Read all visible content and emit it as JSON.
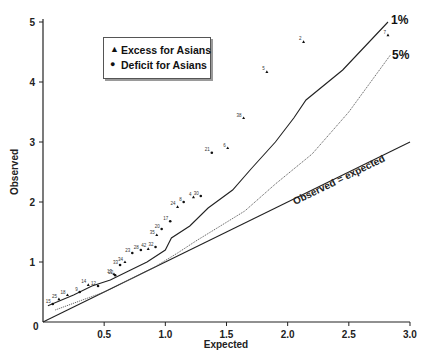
{
  "chart_data": {
    "type": "scatter",
    "title": "",
    "xlabel": "Expected",
    "ylabel": "Observed",
    "xlim": [
      0,
      3.0
    ],
    "ylim": [
      0,
      5
    ],
    "x_ticks": [
      "0.5",
      "1.0",
      "1.5",
      "2.0",
      "2.5",
      "3.0"
    ],
    "y_ticks": [
      "1",
      "2",
      "3",
      "4",
      "5"
    ],
    "origin_label": "0",
    "grid": false,
    "legend": {
      "position": "upper-left",
      "entries": [
        {
          "marker": "triangle",
          "label": "Excess for Asians"
        },
        {
          "marker": "circle",
          "label": "Deficit for Asians"
        }
      ]
    },
    "reference_lines": [
      {
        "name": "Observed = expected",
        "style": "solid",
        "points": [
          [
            0,
            0
          ],
          [
            3.0,
            3.0
          ]
        ]
      },
      {
        "name": "1%",
        "style": "solid",
        "points": [
          [
            0.04,
            0.27
          ],
          [
            0.25,
            0.45
          ],
          [
            0.4,
            0.6
          ],
          [
            0.55,
            0.7
          ],
          [
            0.7,
            0.85
          ],
          [
            0.85,
            1.0
          ],
          [
            1.0,
            1.2
          ],
          [
            1.05,
            1.4
          ],
          [
            1.2,
            1.6
          ],
          [
            1.35,
            1.9
          ],
          [
            1.55,
            2.2
          ],
          [
            1.7,
            2.55
          ],
          [
            1.9,
            3.0
          ],
          [
            2.05,
            3.4
          ],
          [
            2.15,
            3.7
          ],
          [
            2.45,
            4.2
          ],
          [
            2.82,
            5.0
          ]
        ]
      },
      {
        "name": "5%",
        "style": "dotted",
        "points": [
          [
            0.1,
            0.2
          ],
          [
            0.3,
            0.35
          ],
          [
            0.5,
            0.5
          ],
          [
            0.7,
            0.7
          ],
          [
            0.9,
            0.9
          ],
          [
            1.1,
            1.15
          ],
          [
            1.25,
            1.35
          ],
          [
            1.45,
            1.6
          ],
          [
            1.65,
            1.85
          ],
          [
            1.9,
            2.3
          ],
          [
            2.2,
            2.8
          ],
          [
            2.5,
            3.5
          ],
          [
            2.84,
            4.45
          ]
        ]
      }
    ],
    "series": [
      {
        "name": "Excess for Asians",
        "marker": "triangle",
        "points": [
          {
            "id": "7",
            "x": 2.82,
            "y": 4.78
          },
          {
            "id": "2",
            "x": 2.13,
            "y": 4.67
          },
          {
            "id": "5",
            "x": 1.83,
            "y": 4.17
          },
          {
            "id": "38",
            "x": 1.64,
            "y": 3.4
          },
          {
            "id": "6",
            "x": 1.51,
            "y": 2.9
          },
          {
            "id": "4",
            "x": 1.23,
            "y": 2.08
          },
          {
            "id": "24",
            "x": 1.1,
            "y": 1.92
          },
          {
            "id": "35",
            "x": 0.93,
            "y": 1.45
          },
          {
            "id": "42",
            "x": 0.86,
            "y": 1.22
          },
          {
            "id": "34",
            "x": 0.67,
            "y": 1.0
          },
          {
            "id": "13",
            "x": 0.58,
            "y": 0.8
          },
          {
            "id": "14",
            "x": 0.37,
            "y": 0.62
          },
          {
            "id": "18",
            "x": 0.2,
            "y": 0.45
          },
          {
            "id": "25",
            "x": 0.13,
            "y": 0.38
          }
        ]
      },
      {
        "name": "Deficit for Asians",
        "marker": "circle",
        "points": [
          {
            "id": "21",
            "x": 1.38,
            "y": 2.82
          },
          {
            "id": "30",
            "x": 1.29,
            "y": 2.1
          },
          {
            "id": "8",
            "x": 1.15,
            "y": 2.0
          },
          {
            "id": "17",
            "x": 1.04,
            "y": 1.68
          },
          {
            "id": "20",
            "x": 0.97,
            "y": 1.55
          },
          {
            "id": "32",
            "x": 0.92,
            "y": 1.25
          },
          {
            "id": "28",
            "x": 0.8,
            "y": 1.2
          },
          {
            "id": "23",
            "x": 0.73,
            "y": 1.15
          },
          {
            "id": "33",
            "x": 0.63,
            "y": 0.95
          },
          {
            "id": "22",
            "x": 0.59,
            "y": 0.78
          },
          {
            "id": "12",
            "x": 0.45,
            "y": 0.6
          },
          {
            "id": "9",
            "x": 0.3,
            "y": 0.5
          },
          {
            "id": "15",
            "x": 0.08,
            "y": 0.3
          }
        ]
      }
    ],
    "annotations": [
      {
        "text": "1%",
        "x": 2.86,
        "y": 5.0
      },
      {
        "text": "5%",
        "x": 2.88,
        "y": 4.45
      },
      {
        "text": "Observed = expected",
        "x": 2.3,
        "y": 2.45,
        "rotation": -26
      }
    ]
  },
  "legend": {
    "items": [
      {
        "icon": "▲",
        "label": "Excess for Asians"
      },
      {
        "icon": "●",
        "label": "Deficit for Asians"
      }
    ]
  },
  "labels": {
    "xlabel": "Expected",
    "ylabel": "Observed",
    "one_percent": "1%",
    "five_percent": "5%",
    "diagonal": "Observed = expected",
    "origin": "0"
  }
}
